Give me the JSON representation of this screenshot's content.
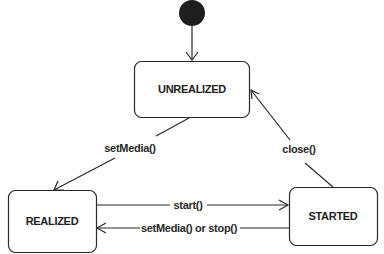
{
  "diagram": {
    "type": "state-machine",
    "initial_state": {
      "name": "initial-state",
      "target": "UNREALIZED"
    },
    "states": [
      {
        "id": "unrealized",
        "label": "UNREALIZED"
      },
      {
        "id": "realized",
        "label": "REALIZED"
      },
      {
        "id": "started",
        "label": "STARTED"
      }
    ],
    "transitions": [
      {
        "from": "UNREALIZED",
        "to": "REALIZED",
        "label": "setMedia()"
      },
      {
        "from": "STARTED",
        "to": "UNREALIZED",
        "label": "close()"
      },
      {
        "from": "REALIZED",
        "to": "STARTED",
        "label": "start()"
      },
      {
        "from": "STARTED",
        "to": "REALIZED",
        "label": "setMedia() or stop()"
      }
    ],
    "colors": {
      "stroke": "#2a2a2a",
      "initial_fill": "#1e1e1e",
      "background": "#ffffff"
    }
  }
}
